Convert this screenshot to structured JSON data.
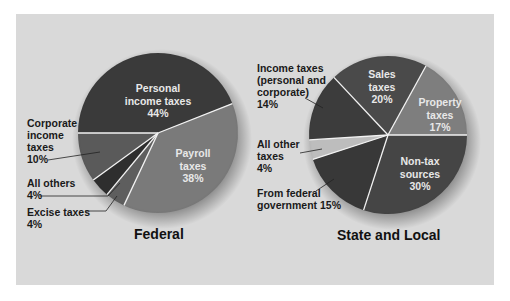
{
  "chart_data": [
    {
      "type": "pie",
      "title": "Federal",
      "categories": [
        "Personal income taxes",
        "Payroll taxes",
        "Excise taxes",
        "All others",
        "Corporate income taxes"
      ],
      "values": [
        44,
        38,
        4,
        4,
        10
      ],
      "unit": "%"
    },
    {
      "type": "pie",
      "title": "State and Local",
      "categories": [
        "Non-tax sources",
        "From federal government",
        "All other taxes",
        "Income taxes (personal and corporate)",
        "Sales taxes",
        "Property taxes"
      ],
      "values": [
        30,
        15,
        4,
        14,
        20,
        17
      ],
      "unit": "%"
    }
  ],
  "federal": {
    "title": "Federal",
    "inside": {
      "personal": "Personal\nincome taxes\n44%",
      "payroll": "Payroll\ntaxes\n38%"
    },
    "callouts": {
      "corporate": "Corporate\nincome\ntaxes\n10%",
      "all_others": "All others\n4%",
      "excise": "Excise taxes\n4%"
    }
  },
  "state": {
    "title": "State and Local",
    "inside": {
      "sales": "Sales\ntaxes\n20%",
      "property": "Property\ntaxes\n17%",
      "nontax": "Non-tax\nsources\n30%"
    },
    "callouts": {
      "income": "Income taxes\n(personal and\ncorporate)\n14%",
      "all_other": "All other\ntaxes\n4%",
      "federal_gov": "From federal\ngovernment 15%"
    }
  },
  "colors": {
    "panel": "#d9d9d9",
    "fed_personal": "#3a3a3a",
    "fed_payroll": "#7a7a7a",
    "fed_excise": "#5e5e5e",
    "fed_allothers": "#2e2e2e",
    "fed_corporate": "#5a5a5a",
    "st_nontax": "#454545",
    "st_federal": "#383838",
    "st_allother": "#bdbdbd",
    "st_income": "#3c3c3c",
    "st_sales": "#4a4a4a",
    "st_property": "#7e7e7e"
  }
}
